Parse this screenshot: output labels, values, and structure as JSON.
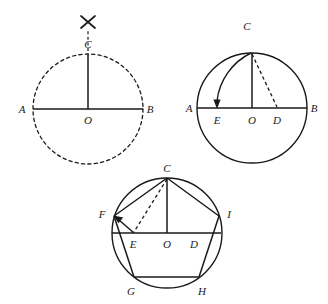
{
  "figure": {
    "stroke_color": "#1a1a1a",
    "label_color": "#1a1a1a",
    "background": "#ffffff"
  },
  "panels": [
    {
      "id": "panel-1",
      "name": "step-1-circle-with-perpendicular-radius",
      "circle": {
        "cx": 88,
        "cy": 109,
        "r": 55,
        "style": "dashed"
      },
      "labels": [
        {
          "key": "A",
          "text": "A",
          "x": 22,
          "y": 113
        },
        {
          "key": "B",
          "text": "B",
          "x": 148,
          "y": 113
        },
        {
          "key": "C",
          "text": "C",
          "x": 84,
          "y": 47
        },
        {
          "key": "O",
          "text": "O",
          "x": 84,
          "y": 124
        }
      ],
      "segments": [
        {
          "name": "diameter-AB",
          "x1": 33,
          "y1": 109,
          "x2": 143,
          "y2": 109,
          "style": "solid"
        },
        {
          "name": "radius-OC",
          "x1": 88,
          "y1": 109,
          "x2": 88,
          "y2": 54,
          "style": "solid"
        },
        {
          "name": "compass-guide-above-C",
          "x1": 88,
          "y1": 52,
          "x2": 88,
          "y2": 30,
          "style": "dashed"
        }
      ],
      "marks": [
        {
          "name": "compass-cross-mark",
          "x": 88,
          "y": 22,
          "size": 9
        }
      ]
    },
    {
      "id": "panel-2",
      "name": "step-2-arc-from-D-to-E",
      "circle": {
        "cx": 252,
        "cy": 108,
        "r": 55,
        "style": "solid"
      },
      "labels": [
        {
          "key": "A",
          "text": "A",
          "x": 186,
          "y": 112
        },
        {
          "key": "B",
          "text": "B",
          "x": 312,
          "y": 112
        },
        {
          "key": "C",
          "text": "C",
          "x": 243,
          "y": 28
        },
        {
          "key": "E",
          "text": "E",
          "x": 213,
          "y": 124
        },
        {
          "key": "O",
          "text": "O",
          "x": 248,
          "y": 124
        },
        {
          "key": "D",
          "text": "D",
          "x": 273,
          "y": 124
        }
      ],
      "segments": [
        {
          "name": "diameter-AB",
          "x1": 197,
          "y1": 108,
          "x2": 307,
          "y2": 108,
          "style": "solid"
        },
        {
          "name": "radius-OC",
          "x1": 252,
          "y1": 108,
          "x2": 252,
          "y2": 53,
          "style": "solid"
        },
        {
          "name": "segment-CD",
          "x1": 252,
          "y1": 53,
          "x2": 277,
          "y2": 108,
          "style": "dashed"
        }
      ],
      "arcs": [
        {
          "name": "arc-C-to-E-with-arrow",
          "x1": 252,
          "y1": 53,
          "x2": 217,
          "y2": 106,
          "rx": 62,
          "ry": 62,
          "sweep": 0,
          "arrow": true
        }
      ]
    },
    {
      "id": "panel-3",
      "name": "step-3-inscribed-regular-pentagon",
      "circle": {
        "cx": 167,
        "cy": 233,
        "r": 55,
        "style": "solid"
      },
      "labels": [
        {
          "key": "C",
          "text": "C",
          "x": 162,
          "y": 170
        },
        {
          "key": "F",
          "text": "F",
          "x": 98,
          "y": 215
        },
        {
          "key": "I",
          "text": "I",
          "x": 226,
          "y": 215
        },
        {
          "key": "E",
          "text": "E",
          "x": 130,
          "y": 248
        },
        {
          "key": "O",
          "text": "O",
          "x": 163,
          "y": 248
        },
        {
          "key": "D",
          "text": "D",
          "x": 190,
          "y": 248
        },
        {
          "key": "G",
          "text": "G",
          "x": 127,
          "y": 292
        },
        {
          "key": "H",
          "text": "H",
          "x": 198,
          "y": 292
        }
      ],
      "vertices": [
        {
          "key": "C",
          "x": 167,
          "y": 178
        },
        {
          "key": "F",
          "x": 114,
          "y": 216
        },
        {
          "key": "I",
          "x": 219,
          "y": 216
        },
        {
          "key": "G",
          "x": 134,
          "y": 277
        },
        {
          "key": "H",
          "x": 199,
          "y": 277
        }
      ],
      "segments": [
        {
          "name": "pentagon-side-CF",
          "x1": 167,
          "y1": 178,
          "x2": 114,
          "y2": 216,
          "style": "solid"
        },
        {
          "name": "pentagon-side-CI",
          "x1": 167,
          "y1": 178,
          "x2": 219,
          "y2": 216,
          "style": "solid"
        },
        {
          "name": "pentagon-side-FG",
          "x1": 114,
          "y1": 216,
          "x2": 134,
          "y2": 277,
          "style": "solid"
        },
        {
          "name": "pentagon-side-IH",
          "x1": 219,
          "y1": 216,
          "x2": 199,
          "y2": 277,
          "style": "solid"
        },
        {
          "name": "pentagon-side-GH",
          "x1": 134,
          "y1": 277,
          "x2": 199,
          "y2": 277,
          "style": "solid"
        },
        {
          "name": "chord-FI",
          "x1": 114,
          "y1": 233,
          "x2": 219,
          "y2": 233,
          "style": "solid"
        },
        {
          "name": "radius-OC",
          "x1": 167,
          "y1": 233,
          "x2": 167,
          "y2": 178,
          "style": "solid"
        },
        {
          "name": "segment-CE",
          "x1": 167,
          "y1": 178,
          "x2": 133,
          "y2": 233,
          "style": "dashed"
        }
      ],
      "arrows": [
        {
          "name": "arrow-E-to-F",
          "x1": 133,
          "y1": 233,
          "x2": 116,
          "y2": 218
        }
      ]
    }
  ]
}
